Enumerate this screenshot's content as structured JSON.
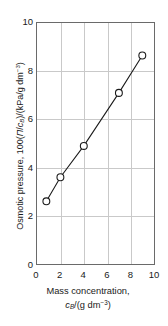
{
  "chart_data": {
    "type": "line",
    "title": "",
    "subtitle": "",
    "x": [
      0.8,
      2.0,
      4.0,
      7.0,
      9.0
    ],
    "values": [
      2.6,
      3.6,
      4.9,
      7.1,
      8.65
    ],
    "series": [
      {
        "name": "Osmotic pressure ratio",
        "x": [
          0.8,
          2.0,
          4.0,
          7.0,
          9.0
        ],
        "values": [
          2.6,
          3.6,
          4.9,
          7.1,
          8.65
        ]
      }
    ],
    "xlabel": "Mass concentration, cB/(g dm-3)",
    "ylabel": "Osmotic pressure, 100(П/cB)/(kPa/g dm-3)",
    "xlim": [
      0,
      10
    ],
    "ylim": [
      0,
      10
    ],
    "xticks": [
      "0",
      "2",
      "4",
      "6",
      "8",
      "10"
    ],
    "yticks": [
      "0",
      "2",
      "4",
      "6",
      "8",
      "10"
    ],
    "xtick_values": [
      0,
      2,
      4,
      6,
      8,
      10
    ],
    "ytick_values": [
      0,
      2,
      4,
      6,
      8,
      10
    ],
    "grid": true,
    "legend": "none",
    "marker": "open-circle",
    "marker_size": 7,
    "line_color": "#1a1a1a",
    "grid_color": "#c9c9c9",
    "frame_color": "#6a6a6a"
  },
  "labels": {
    "y_axis": {
      "prefix": "Osmotic pressure, 100(",
      "pi_symbol": "Π",
      "slash": "/",
      "c_symbol": "c",
      "c_subscript": "B",
      "suffix": ")/(kPa/g dm",
      "exponent": "−3",
      "close": ")"
    },
    "x_axis": {
      "line1": "Mass concentration,",
      "c_symbol": "c",
      "c_subscript": "B",
      "units_open": "/(g dm",
      "exponent": "−3",
      "close": ")"
    }
  }
}
